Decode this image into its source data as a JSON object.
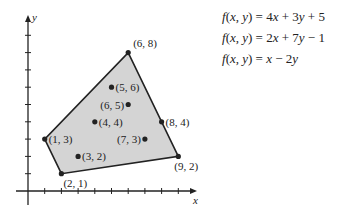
{
  "chart_data": {
    "type": "scatter",
    "title": "",
    "xlabel": "x",
    "ylabel": "y",
    "xlim": [
      0,
      10
    ],
    "ylim": [
      0,
      10
    ],
    "grid": false,
    "region_vertices": [
      [
        2,
        1
      ],
      [
        1,
        3
      ],
      [
        6,
        8
      ],
      [
        9,
        2
      ]
    ],
    "points": [
      {
        "x": 6,
        "y": 8,
        "label": "(6, 8)"
      },
      {
        "x": 5,
        "y": 6,
        "label": "(5, 6)"
      },
      {
        "x": 6,
        "y": 5,
        "label": "(6, 5)"
      },
      {
        "x": 4,
        "y": 4,
        "label": "(4, 4)"
      },
      {
        "x": 8,
        "y": 4,
        "label": "(8, 4)"
      },
      {
        "x": 1,
        "y": 3,
        "label": "(1, 3)"
      },
      {
        "x": 7,
        "y": 3,
        "label": "(7, 3)"
      },
      {
        "x": 3,
        "y": 2,
        "label": "(3, 2)"
      },
      {
        "x": 9,
        "y": 2,
        "label": "(9, 2)"
      },
      {
        "x": 2,
        "y": 1,
        "label": "(2, 1)"
      }
    ]
  },
  "axes": {
    "x_label": "x",
    "y_label": "y"
  },
  "equations": [
    "f(x, y) = 4x + 3y + 5",
    "f(x, y) = 2x + 7y − 1",
    "f(x, y) = x − 2y"
  ],
  "colors": {
    "region_fill": "#d4d4d4",
    "stroke": "#222222"
  }
}
